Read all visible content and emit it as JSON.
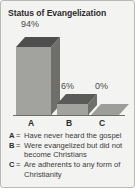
{
  "chart_data": {
    "type": "bar",
    "title": "Status of Evangelization",
    "xlabel": "",
    "ylabel": "",
    "categories": [
      "A",
      "B",
      "C"
    ],
    "values": [
      94,
      6,
      0
    ],
    "value_labels": [
      "94%",
      "6%",
      "0%"
    ],
    "ylim": [
      0,
      100
    ],
    "grid": false,
    "legend_position": "below",
    "style": "3d-column",
    "legend": [
      {
        "key": "A",
        "separator": "=",
        "text": "Have never heard the gospel"
      },
      {
        "key": "B",
        "separator": "=",
        "text": "Were evangelized but did not become Christians"
      },
      {
        "key": "C",
        "separator": "=",
        "text": "Are adherents to any form of Christianity"
      }
    ],
    "colors": {
      "panel_background": "#f3f3f1",
      "panel_border": "#b9b9b5",
      "bar_front": "#a2a29e",
      "bar_top": "#4f4f4f",
      "bar_side": "#6e6e6a",
      "axis": "#6b6b67",
      "title_text": "#2b2b2b",
      "body_text": "#3b3b3b"
    }
  }
}
